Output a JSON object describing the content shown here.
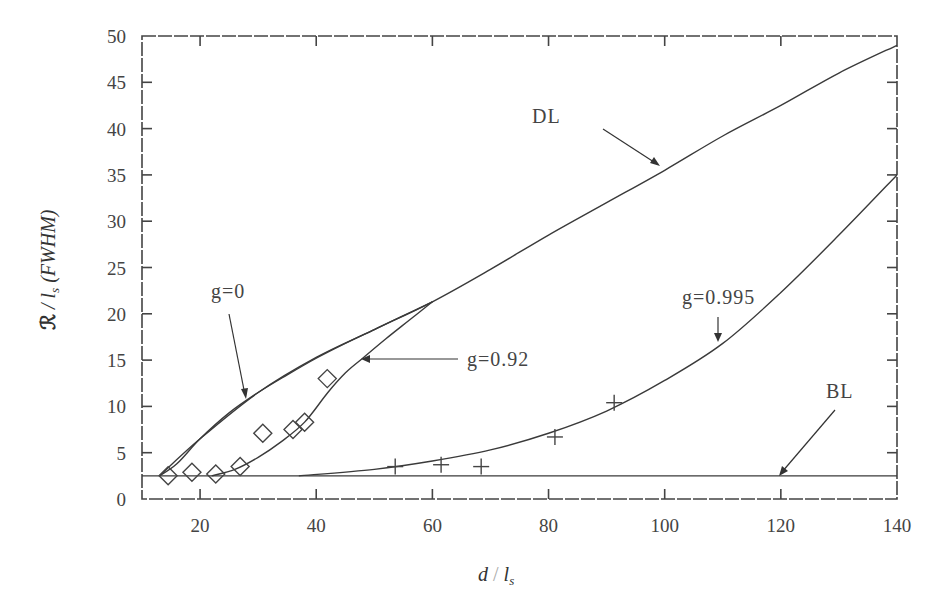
{
  "chart_data": {
    "type": "line",
    "title": "",
    "xlabel": "d / l_s",
    "ylabel": "ℛ / l_s (FWHM)",
    "xlim": [
      10,
      140
    ],
    "ylim": [
      0,
      50
    ],
    "grid": false,
    "legend": "inline annotations",
    "x_ticks": [
      20,
      40,
      60,
      80,
      100,
      120,
      140
    ],
    "x_tick_labels": [
      "20",
      "40",
      "60",
      "80",
      "100",
      "120",
      "140"
    ],
    "y_ticks": [
      0,
      5,
      10,
      15,
      20,
      25,
      30,
      35,
      40,
      45,
      50
    ],
    "y_tick_labels": [
      "0",
      "5",
      "10",
      "15",
      "20",
      "25",
      "30",
      "35",
      "40",
      "45",
      "50"
    ],
    "series": [
      {
        "name": "DL",
        "kind": "line",
        "x": [
          13,
          20,
          30,
          40,
          50,
          60,
          70,
          80,
          90,
          100,
          110,
          120,
          130,
          140
        ],
        "y": [
          2.5,
          6.5,
          11.5,
          15.3,
          18.3,
          21.3,
          24.8,
          28.5,
          32,
          35.5,
          39.2,
          42.5,
          46,
          49
        ]
      },
      {
        "name": "g=0",
        "kind": "line",
        "x": [
          13,
          16,
          20,
          25,
          30,
          35,
          40,
          45,
          50,
          55,
          60
        ],
        "y": [
          2.5,
          3.8,
          6.5,
          9.3,
          11.5,
          13.4,
          15.2,
          16.8,
          18.3,
          19.8,
          21.3
        ]
      },
      {
        "name": "g=0.92",
        "kind": "line",
        "x": [
          22,
          26,
          30,
          34,
          38,
          42,
          45,
          48,
          52,
          56,
          60
        ],
        "y": [
          2.5,
          3.2,
          4.5,
          6.2,
          8.3,
          11.5,
          13.6,
          15.2,
          17.3,
          19.3,
          21.3
        ]
      },
      {
        "name": "g=0.995",
        "kind": "line",
        "x": [
          37,
          50,
          60,
          70,
          80,
          90,
          100,
          110,
          120,
          130,
          140
        ],
        "y": [
          2.5,
          3.2,
          4.1,
          5.3,
          7.1,
          9.5,
          12.8,
          16.8,
          22.3,
          28.5,
          35
        ]
      },
      {
        "name": "BL",
        "kind": "line",
        "x": [
          10,
          140
        ],
        "y": [
          2.5,
          2.5
        ]
      },
      {
        "name": "g=0.92 data",
        "kind": "scatter",
        "marker": "diamond",
        "x": [
          14.5,
          18.6,
          22.7,
          26.9,
          30.8,
          36,
          38,
          41.9
        ],
        "y": [
          2.5,
          2.9,
          2.7,
          3.5,
          7.1,
          7.5,
          8.3,
          13
        ]
      },
      {
        "name": "g=0.995 data",
        "kind": "scatter",
        "marker": "cross",
        "x": [
          53.6,
          61.5,
          68.4,
          81.1,
          91.3
        ],
        "y": [
          3.5,
          3.7,
          3.5,
          6.7,
          10.4
        ]
      }
    ],
    "annotations": [
      {
        "text": "DL",
        "x": 67,
        "y": 41
      },
      {
        "text": "g=0",
        "x": 18,
        "y": 20
      },
      {
        "text": "g=0.92",
        "x": 57,
        "y": 14.5
      },
      {
        "text": "g=0.995",
        "x": 98,
        "y": 21
      },
      {
        "text": "BL",
        "x": 124,
        "y": 10
      }
    ]
  },
  "labels": {
    "xlabel_main": "d",
    "xlabel_sep": " / ",
    "xlabel_var": "l",
    "xlabel_sub": "s",
    "ylabel_symbol": "ℛ",
    "ylabel_rest": " / l",
    "ylabel_sub": "s",
    "ylabel_suffix": " (FWHM)",
    "anno_dl": "DL",
    "anno_g0": "g=0",
    "anno_g092": "g=0.92",
    "anno_g0995": "g=0.995",
    "anno_bl": "BL"
  }
}
